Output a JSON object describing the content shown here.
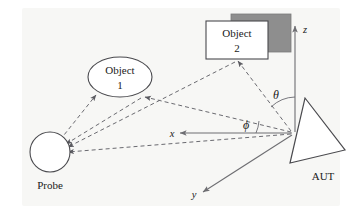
{
  "diagram": {
    "background_color": "#f7f7f5",
    "line_color": "#6a6a70",
    "shadow_color": "#8e8e8e",
    "labels": {
      "object1_line1": "Object",
      "object1_line2": "1",
      "object2_line1": "Object",
      "object2_line2": "2",
      "probe": "Probe",
      "aut": "AUT",
      "axis_x": "x",
      "axis_y": "y",
      "axis_z": "z",
      "angle_theta": "θ",
      "angle_phi": "ϕ"
    },
    "elements": [
      {
        "name": "probe-circle",
        "kind": "circle",
        "label": "Probe"
      },
      {
        "name": "object-1-ellipse",
        "kind": "ellipse",
        "label": "Object 1"
      },
      {
        "name": "object-2-box",
        "kind": "rectangle",
        "label": "Object 2"
      },
      {
        "name": "object-2-shadow",
        "kind": "rectangle",
        "label": ""
      },
      {
        "name": "aut-triangle",
        "kind": "triangle",
        "label": "AUT"
      },
      {
        "name": "axis-x",
        "kind": "arrow",
        "label": "x"
      },
      {
        "name": "axis-y",
        "kind": "arrow",
        "label": "y"
      },
      {
        "name": "axis-z",
        "kind": "arrow",
        "label": "z"
      },
      {
        "name": "theta-arc",
        "kind": "arc",
        "label": "θ"
      },
      {
        "name": "phi-arc",
        "kind": "arc",
        "label": "ϕ"
      }
    ],
    "ray_paths": [
      {
        "name": "ray-aut-to-object1",
        "from": "AUT",
        "to": "Object 1",
        "style": "dashed"
      },
      {
        "name": "ray-aut-to-object2",
        "from": "AUT",
        "to": "Object 2",
        "style": "dashed"
      },
      {
        "name": "ray-aut-to-probe",
        "from": "AUT",
        "to": "Probe",
        "style": "dashed"
      },
      {
        "name": "ray-object1-to-probe",
        "from": "Object 1",
        "to": "Probe",
        "style": "dashed"
      },
      {
        "name": "ray-object2-to-probe",
        "from": "Object 2",
        "to": "Probe",
        "style": "dashed"
      }
    ]
  }
}
